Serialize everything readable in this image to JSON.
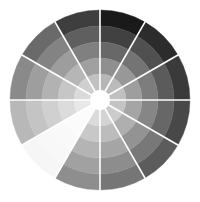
{
  "wheel": {
    "center": [
      100,
      100
    ],
    "outer_radius": 90,
    "inner_radius": 10,
    "ring_count": 5,
    "sector_count": 12,
    "separator_color": "#ffffff",
    "separator_width": 1.6,
    "center_color": "#ffffff",
    "sectors": [
      {
        "base": "#1a1a1a"
      },
      {
        "base": "#2c2c2c"
      },
      {
        "base": "#3a3a3a"
      },
      {
        "base": "#484848"
      },
      {
        "base": "#5c5c5c"
      },
      {
        "base": "#767676"
      },
      {
        "base": "#8e8e8e"
      },
      {
        "base": "#f6f6f6"
      },
      {
        "base": "#b8b8b8"
      },
      {
        "base": "#8a8a8a"
      },
      {
        "base": "#6a6a6a"
      },
      {
        "base": "#3e3e3e"
      }
    ]
  }
}
